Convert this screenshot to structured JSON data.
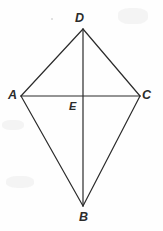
{
  "figure": {
    "kind": "geometry-diagram",
    "width": 163,
    "height": 231,
    "background_color": "#fefefe",
    "stroke_color": "#2b2b2b",
    "stroke_width": 1.2,
    "label_color": "#2b2b2b"
  },
  "points": {
    "D": {
      "label": "D",
      "x": 83,
      "y": 29,
      "label_x": 75,
      "label_y": 12
    },
    "A": {
      "label": "A",
      "x": 21,
      "y": 96,
      "label_x": 8,
      "label_y": 89
    },
    "C": {
      "label": "C",
      "x": 140,
      "y": 96,
      "label_x": 142,
      "label_y": 89
    },
    "B": {
      "label": "B",
      "x": 83,
      "y": 206,
      "label_x": 79,
      "label_y": 211
    },
    "E": {
      "label": "E",
      "x": 83,
      "y": 96,
      "label_x": 69,
      "label_y": 101
    }
  },
  "segments": [
    {
      "name": "AD",
      "from": "A",
      "to": "D"
    },
    {
      "name": "DC",
      "from": "D",
      "to": "C"
    },
    {
      "name": "CB",
      "from": "C",
      "to": "B"
    },
    {
      "name": "BA",
      "from": "B",
      "to": "A"
    },
    {
      "name": "AC",
      "from": "A",
      "to": "C"
    },
    {
      "name": "DB",
      "from": "D",
      "to": "B"
    }
  ],
  "artifacts": {
    "speck_top": "scan-speck",
    "smudges": [
      "lower-left",
      "upper-right",
      "mid-left"
    ]
  }
}
